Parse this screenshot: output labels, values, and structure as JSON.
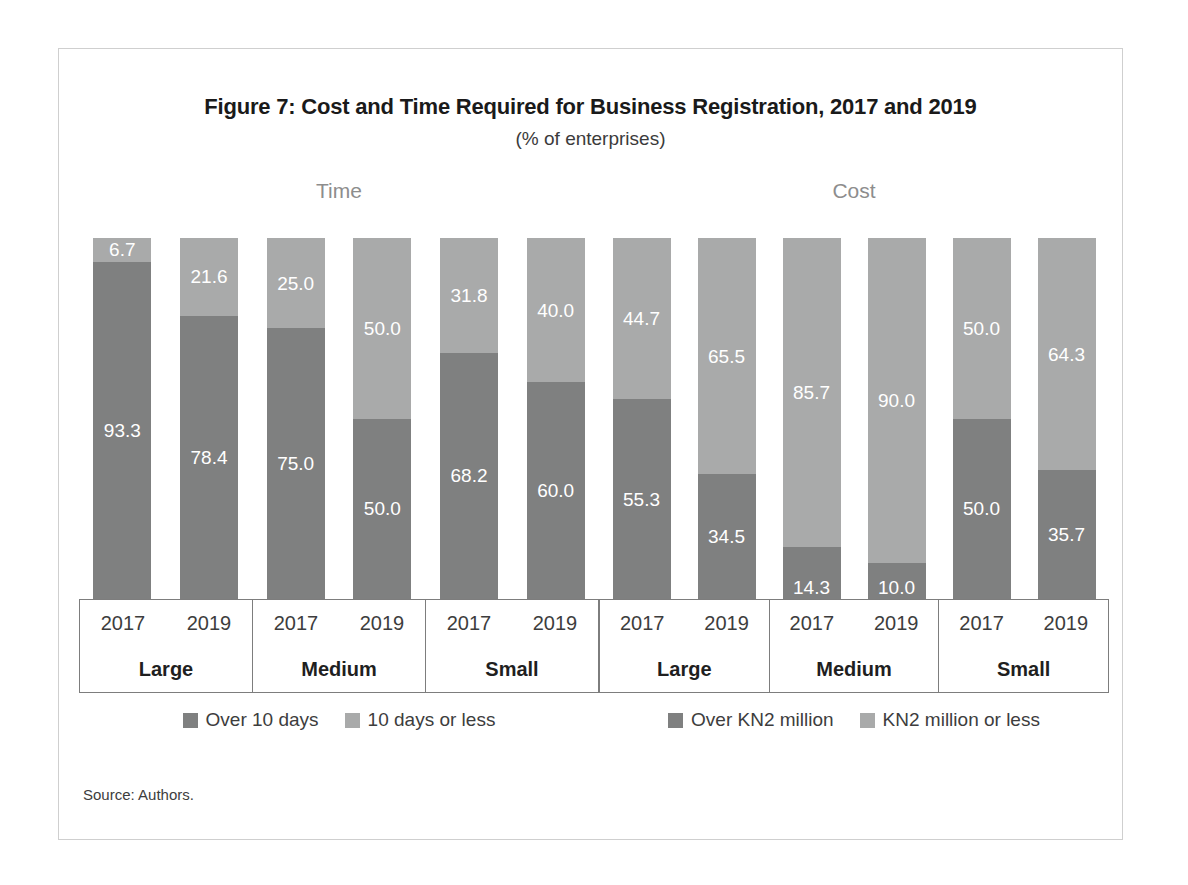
{
  "figure": {
    "title": "Figure 7: Cost and Time Required for Business Registration, 2017 and 2019",
    "subtitle": "(% of enterprises)",
    "source": "Source: Authors."
  },
  "colors": {
    "dark": "#7f8080",
    "light": "#a9aaaa",
    "axis_line": "#7d7d7d",
    "frame": "#cfcfcf",
    "panel_title": "#8d8d8d",
    "value_label": "#ffffff"
  },
  "panels": {
    "time": {
      "title": "Time",
      "legend": [
        {
          "label": "Over 10 days",
          "color": "#7f8080"
        },
        {
          "label": "10 days or less",
          "color": "#a9aaaa"
        }
      ],
      "groups": [
        {
          "category": "Large",
          "bars": [
            {
              "year": "2017",
              "dark": 93.3,
              "light": 6.7
            },
            {
              "year": "2019",
              "dark": 78.4,
              "light": 21.6
            }
          ]
        },
        {
          "category": "Medium",
          "bars": [
            {
              "year": "2017",
              "dark": 75.0,
              "light": 25.0
            },
            {
              "year": "2019",
              "dark": 50.0,
              "light": 50.0
            }
          ]
        },
        {
          "category": "Small",
          "bars": [
            {
              "year": "2017",
              "dark": 68.2,
              "light": 31.8
            },
            {
              "year": "2019",
              "dark": 60.0,
              "light": 40.0
            }
          ]
        }
      ]
    },
    "cost": {
      "title": "Cost",
      "legend": [
        {
          "label": "Over KN2 million",
          "color": "#7f8080"
        },
        {
          "label": "KN2 million or less",
          "color": "#a9aaaa"
        }
      ],
      "groups": [
        {
          "category": "Large",
          "bars": [
            {
              "year": "2017",
              "dark": 55.3,
              "light": 44.7
            },
            {
              "year": "2019",
              "dark": 34.5,
              "light": 65.5
            }
          ]
        },
        {
          "category": "Medium",
          "bars": [
            {
              "year": "2017",
              "dark": 14.3,
              "light": 85.7
            },
            {
              "year": "2019",
              "dark": 10.0,
              "light": 90.0
            }
          ]
        },
        {
          "category": "Small",
          "bars": [
            {
              "year": "2017",
              "dark": 50.0,
              "light": 50.0
            },
            {
              "year": "2019",
              "dark": 35.7,
              "light": 64.3
            }
          ]
        }
      ]
    }
  },
  "chart_data": {
    "type": "bar",
    "title": "Figure 7: Cost and Time Required for Business Registration, 2017 and 2019",
    "subtitle": "(% of enterprises)",
    "ylabel": "% of enterprises",
    "xlabel": "",
    "ylim": [
      0,
      100
    ],
    "stacked": true,
    "grid": false,
    "legend_position": "bottom",
    "source": "Source: Authors.",
    "panels": [
      {
        "name": "Time",
        "categories": [
          "Large 2017",
          "Large 2019",
          "Medium 2017",
          "Medium 2019",
          "Small 2017",
          "Small 2019"
        ],
        "series": [
          {
            "name": "Over 10 days",
            "values": [
              93.3,
              78.4,
              75.0,
              50.0,
              68.2,
              60.0
            ],
            "color": "#7f8080"
          },
          {
            "name": "10 days or less",
            "values": [
              6.7,
              21.6,
              25.0,
              50.0,
              31.8,
              40.0
            ],
            "color": "#a9aaaa"
          }
        ]
      },
      {
        "name": "Cost",
        "categories": [
          "Large 2017",
          "Large 2019",
          "Medium 2017",
          "Medium 2019",
          "Small 2017",
          "Small 2019"
        ],
        "series": [
          {
            "name": "Over KN2 million",
            "values": [
              55.3,
              34.5,
              14.3,
              10.0,
              50.0,
              35.7
            ],
            "color": "#7f8080"
          },
          {
            "name": "KN2 million or less",
            "values": [
              44.7,
              65.5,
              85.7,
              90.0,
              50.0,
              64.3
            ],
            "color": "#a9aaaa"
          }
        ]
      }
    ]
  }
}
